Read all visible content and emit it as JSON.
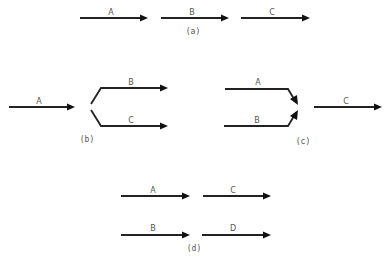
{
  "colors": {
    "line": "#222222",
    "text": "#555555",
    "background": "#ffffff"
  },
  "panels": {
    "a": {
      "caption": "(a)",
      "labels": [
        "A",
        "B",
        "C"
      ]
    },
    "b": {
      "caption": "(b)",
      "labels": {
        "input": "A",
        "upper": "B",
        "lower": "C"
      }
    },
    "c": {
      "caption": "(c)",
      "labels": {
        "upper": "A",
        "lower": "B",
        "output": "C"
      }
    },
    "d": {
      "caption": "(d)",
      "labels": {
        "top_left": "A",
        "top_right": "C",
        "bottom_left": "B",
        "bottom_right": "D"
      }
    }
  }
}
